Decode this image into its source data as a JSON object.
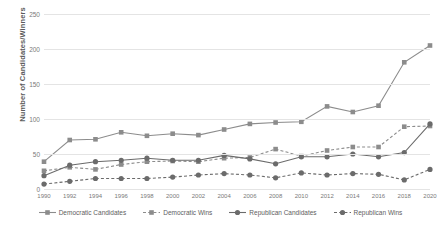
{
  "chart_data": {
    "type": "line",
    "title": "",
    "xlabel": "",
    "ylabel": "Number of Candidates/Winners",
    "x": [
      1990,
      1992,
      1994,
      1996,
      1998,
      2000,
      2002,
      2004,
      2006,
      2008,
      2010,
      2012,
      2014,
      2016,
      2018,
      2020
    ],
    "xticklabels": [
      "1990",
      "1992",
      "1994",
      "1996",
      "1998",
      "2000",
      "2002",
      "2004",
      "2006",
      "2008",
      "2010",
      "2012",
      "2014",
      "2016",
      "2018",
      "2020"
    ],
    "ylim": [
      0,
      250
    ],
    "yticks": [
      0,
      50,
      100,
      150,
      200,
      250
    ],
    "yticklabels": [
      "0",
      "50",
      "100",
      "150",
      "200",
      "250"
    ],
    "grid": true,
    "legend_position": "bottom",
    "series": [
      {
        "name": "Democratic Candidates",
        "color": "#8c8c8c",
        "linestyle": "solid",
        "marker": "square",
        "values": [
          39,
          70,
          71,
          81,
          76,
          79,
          77,
          85,
          93,
          95,
          96,
          118,
          110,
          119,
          181,
          205
        ]
      },
      {
        "name": "Democratic Wins",
        "color": "#8c8c8c",
        "linestyle": "dashed",
        "marker": "square",
        "values": [
          26,
          31,
          28,
          35,
          39,
          40,
          39,
          44,
          45,
          57,
          47,
          55,
          60,
          60,
          89,
          90
        ]
      },
      {
        "name": "Republican Candidates",
        "color": "#6b6b6b",
        "linestyle": "solid",
        "marker": "circle",
        "values": [
          19,
          34,
          39,
          41,
          44,
          41,
          41,
          48,
          43,
          36,
          46,
          46,
          50,
          46,
          52,
          93
        ]
      },
      {
        "name": "Republican Wins",
        "color": "#6b6b6b",
        "linestyle": "dashed",
        "marker": "circle",
        "values": [
          7,
          11,
          15,
          15,
          15,
          17,
          20,
          22,
          20,
          16,
          23,
          20,
          22,
          21,
          13,
          28
        ]
      }
    ]
  }
}
